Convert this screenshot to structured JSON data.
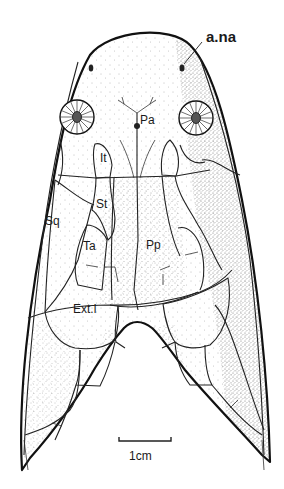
{
  "figure": {
    "background": "#ffffff",
    "ink_color": "#111111",
    "labels": {
      "anterior_naris": "a.na",
      "parietal": "Pa",
      "intertemporal": "It",
      "supratemporal": "St",
      "squamosal": "Sq",
      "tabular": "Ta",
      "postparietal": "Pp",
      "extrascapular_lateral": "Ext.l"
    },
    "scale_bar": {
      "label": "1cm",
      "length_px": 52
    }
  }
}
